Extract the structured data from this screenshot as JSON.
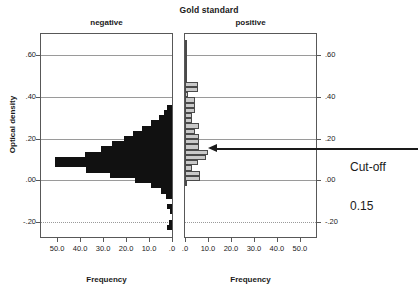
{
  "chart_data": {
    "type": "bar",
    "title": "Gold standard",
    "orientation": "horizontal",
    "layout": "back-to-back mirrored histogram (population pyramid)",
    "ylabel": "Optical density",
    "xlabel": "Frequency",
    "ylim": [
      -0.27,
      0.7
    ],
    "y_ticks": [
      ".60",
      ".40",
      ".20",
      ".00",
      "-.20"
    ],
    "y_tick_values": [
      0.6,
      0.4,
      0.2,
      0.0,
      -0.2
    ],
    "grid": true,
    "legend": "none",
    "panels": [
      {
        "name": "negative",
        "label": "negative",
        "color": "#111111",
        "xlabel": "Frequency",
        "x_ticks": [
          "50.0",
          "40.0",
          "30.0",
          "20.0",
          "10.0",
          ".0"
        ],
        "x_tick_values": [
          50.0,
          40.0,
          30.0,
          20.0,
          10.0,
          0.0
        ],
        "x_direction": "reversed",
        "xlim": [
          0,
          57
        ],
        "bin_width": 0.025,
        "bins": [
          {
            "center": 0.35,
            "frequency": 2.0
          },
          {
            "center": 0.325,
            "frequency": 3.5
          },
          {
            "center": 0.3,
            "frequency": 5.5
          },
          {
            "center": 0.275,
            "frequency": 9.0
          },
          {
            "center": 0.25,
            "frequency": 13.0
          },
          {
            "center": 0.225,
            "frequency": 17.0
          },
          {
            "center": 0.2,
            "frequency": 21.0
          },
          {
            "center": 0.175,
            "frequency": 26.0
          },
          {
            "center": 0.15,
            "frequency": 31.0
          },
          {
            "center": 0.125,
            "frequency": 38.0
          },
          {
            "center": 0.1,
            "frequency": 51.0
          },
          {
            "center": 0.075,
            "frequency": 51.0
          },
          {
            "center": 0.05,
            "frequency": 37.5
          },
          {
            "center": 0.025,
            "frequency": 27.0
          },
          {
            "center": 0.0,
            "frequency": 16.0
          },
          {
            "center": -0.025,
            "frequency": 9.0
          },
          {
            "center": -0.05,
            "frequency": 5.0
          },
          {
            "center": -0.075,
            "frequency": 2.5
          },
          {
            "center": -0.125,
            "frequency": 2.0
          },
          {
            "center": -0.15,
            "frequency": 1.0
          },
          {
            "center": -0.2,
            "frequency": 1.5
          },
          {
            "center": -0.225,
            "frequency": 2.0
          }
        ]
      },
      {
        "name": "positive",
        "label": "positive",
        "color": "#c9c9c9",
        "edge_color": "#4a4a4a",
        "xlabel": "Frequency",
        "x_ticks": [
          ".0",
          "10.0",
          "20.0",
          "30.0",
          "40.0",
          "50.0"
        ],
        "x_tick_values": [
          0.0,
          10.0,
          20.0,
          30.0,
          40.0,
          50.0
        ],
        "x_direction": "normal",
        "xlim": [
          0,
          57
        ],
        "bin_width": 0.025,
        "bins": [
          {
            "center": 0.66,
            "frequency": 1.0
          },
          {
            "center": 0.635,
            "frequency": 1.0
          },
          {
            "center": 0.61,
            "frequency": 1.0
          },
          {
            "center": 0.585,
            "frequency": 1.0
          },
          {
            "center": 0.56,
            "frequency": 1.0
          },
          {
            "center": 0.535,
            "frequency": 1.0
          },
          {
            "center": 0.51,
            "frequency": 1.0
          },
          {
            "center": 0.485,
            "frequency": 1.0
          },
          {
            "center": 0.46,
            "frequency": 5.5
          },
          {
            "center": 0.435,
            "frequency": 5.5
          },
          {
            "center": 0.41,
            "frequency": 1.5
          },
          {
            "center": 0.385,
            "frequency": 4.5
          },
          {
            "center": 0.36,
            "frequency": 4.5
          },
          {
            "center": 0.335,
            "frequency": 4.5
          },
          {
            "center": 0.31,
            "frequency": 3.0
          },
          {
            "center": 0.285,
            "frequency": 3.0
          },
          {
            "center": 0.26,
            "frequency": 6.0
          },
          {
            "center": 0.235,
            "frequency": 4.5
          },
          {
            "center": 0.21,
            "frequency": 6.0
          },
          {
            "center": 0.185,
            "frequency": 6.0
          },
          {
            "center": 0.16,
            "frequency": 6.0
          },
          {
            "center": 0.135,
            "frequency": 10.0
          },
          {
            "center": 0.11,
            "frequency": 9.0
          },
          {
            "center": 0.085,
            "frequency": 5.5
          },
          {
            "center": 0.06,
            "frequency": 3.0
          },
          {
            "center": 0.035,
            "frequency": 6.5
          },
          {
            "center": 0.01,
            "frequency": 6.5
          },
          {
            "center": -0.015,
            "frequency": 1.0
          }
        ]
      }
    ],
    "annotations": [
      {
        "name": "cut-off",
        "text_line1": "Cut-off",
        "text_line2": "0.15",
        "value": 0.15,
        "points_to_panel": "positive",
        "arrow": "left"
      }
    ]
  }
}
